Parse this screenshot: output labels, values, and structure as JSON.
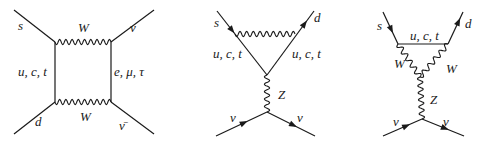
{
  "diagrams": [
    {
      "name": "box-diagram",
      "labels": {
        "s": "s",
        "d": "d",
        "nu_top": "ν",
        "nu_bar": "ν̄",
        "w_top": "W",
        "w_bottom": "W",
        "quarks": "u, c, t",
        "leptons": "e, μ, τ"
      }
    },
    {
      "name": "z-penguin-quark",
      "labels": {
        "s": "s",
        "d": "d",
        "quarks_left": "u, c, t",
        "quarks_right": "u, c, t",
        "z": "Z",
        "nu_in": "ν",
        "nu_out": "ν"
      }
    },
    {
      "name": "z-penguin-w",
      "labels": {
        "s": "s",
        "d": "d",
        "quarks": "u, c, t",
        "w_left": "W",
        "w_right": "W",
        "z": "Z",
        "nu_in": "ν",
        "nu_out": "ν"
      }
    }
  ]
}
